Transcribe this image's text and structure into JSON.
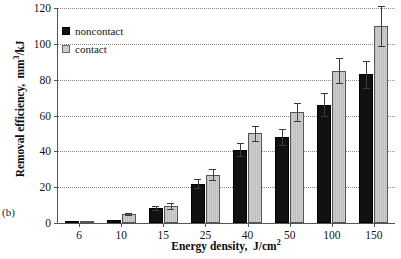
{
  "panel_label": "(b)",
  "legend": {
    "position": "top-left-inside",
    "entries": [
      {
        "label": "noncontact",
        "color": "#111111",
        "swatch": "filled-square-icon"
      },
      {
        "label": "contact",
        "color": "#cccccc",
        "swatch": "hatched-square-icon"
      }
    ]
  },
  "axes": {
    "y_ticks": [
      "0",
      "20",
      "40",
      "60",
      "80",
      "100",
      "120"
    ],
    "x_ticks": [
      "6",
      "10",
      "15",
      "25",
      "40",
      "50",
      "100",
      "150"
    ]
  },
  "chart_data": {
    "type": "bar",
    "title": "",
    "subtitle": "",
    "panel": "(b)",
    "xlabel": "Energy density,  J/cm2",
    "xlabel_html": "Energy density,  J/cm<sup>2</sup>",
    "ylabel": "Removal efficiency,  mm3/kJ",
    "ylabel_html": "Removal efficiency,  mm<sup>3</sup>/kJ",
    "categories": [
      "6",
      "10",
      "15",
      "25",
      "40",
      "50",
      "100",
      "150"
    ],
    "ylim": [
      0,
      120
    ],
    "ytick_step": 20,
    "yticks": [
      0,
      20,
      40,
      60,
      80,
      100,
      120
    ],
    "grid": true,
    "grid_axis": "y",
    "grid_style": "dotted",
    "legend_position": "upper left",
    "series": [
      {
        "name": "noncontact",
        "color": "#111111",
        "values": [
          0.8,
          1.5,
          8.5,
          22,
          41,
          48,
          66,
          83
        ],
        "errors": [
          0.3,
          0.6,
          1.2,
          2.5,
          3.5,
          4.5,
          6.5,
          7.5
        ]
      },
      {
        "name": "contact",
        "color": "#cccccc",
        "values": [
          1.0,
          5.0,
          9.5,
          27,
          50,
          62,
          85,
          110
        ],
        "errors": [
          0.4,
          0.8,
          1.5,
          3.0,
          4.0,
          5.0,
          7.0,
          11.0
        ]
      }
    ]
  }
}
